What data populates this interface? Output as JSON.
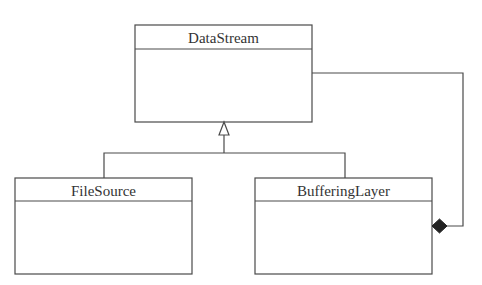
{
  "diagram": {
    "type": "uml-class-diagram",
    "classes": [
      {
        "id": "datastream",
        "name": "DataStream"
      },
      {
        "id": "filesource",
        "name": "FileSource"
      },
      {
        "id": "bufferinglayer",
        "name": "BufferingLayer"
      }
    ],
    "relationships": [
      {
        "type": "generalization",
        "from": "FileSource",
        "to": "DataStream"
      },
      {
        "type": "generalization",
        "from": "BufferingLayer",
        "to": "DataStream"
      },
      {
        "type": "composition",
        "whole": "BufferingLayer",
        "part": "DataStream"
      }
    ],
    "colors": {
      "line": "#4a4a4a",
      "text": "#333333",
      "background": "#ffffff",
      "diamond": "#222222"
    }
  }
}
